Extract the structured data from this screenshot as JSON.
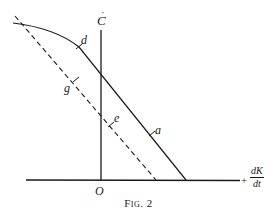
{
  "figure": {
    "caption": "Fig. 2",
    "colors": {
      "ink": "#1a1a1a",
      "background": "#ffffff"
    },
    "axes": {
      "y_axis": {
        "label": "C",
        "label_accent": "˙",
        "description": "C-dot (rate of change of C)"
      },
      "x_axis": {
        "sign": "+",
        "label_numerator": "dK",
        "label_denominator": "dt"
      },
      "origin_label": "O"
    },
    "curves": [
      {
        "id": "solid",
        "style": "solid",
        "description": "Curve bending from upper-left, becoming straight line down to x-axis",
        "markers": [
          {
            "label": "d",
            "position": "on curved upper segment"
          },
          {
            "label": "a",
            "position": "on straight lower segment, right of C-axis"
          }
        ]
      },
      {
        "id": "dashed",
        "style": "dashed",
        "description": "Straight dashed line parallel to solid line's straight portion, crossing C-axis below solid line",
        "markers": [
          {
            "label": "g",
            "position": "left of C-axis"
          },
          {
            "label": "e",
            "position": "just right of C-axis"
          }
        ]
      }
    ],
    "point_labels": {
      "d": "d",
      "a": "a",
      "g": "g",
      "e": "e"
    }
  }
}
